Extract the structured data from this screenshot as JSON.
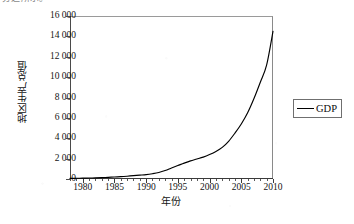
{
  "caption": {
    "truncated_top_text": "分之所示。"
  },
  "legend": {
    "position": "right",
    "entries": [
      {
        "label": "GDP",
        "color": "#000000",
        "marker": "line"
      }
    ]
  },
  "axes": {
    "y_tick_labels": [
      "16 000",
      "14 000",
      "12 000",
      "10 000",
      "8 000",
      "6 000",
      "4 000",
      "2 000",
      "0"
    ],
    "x_tick_labels": [
      "1980",
      "1985",
      "1990",
      "1995",
      "2000",
      "2005",
      "2010"
    ]
  },
  "chart_data": {
    "type": "line",
    "title": "",
    "xlabel": "年份",
    "ylabel": "地区生产总值",
    "xlim": [
      1978,
      2010
    ],
    "ylim": [
      0,
      16000
    ],
    "ytick_step": 2000,
    "xtick_step": 5,
    "x_minor_tick_step": 1,
    "grid": false,
    "legend_position": "right",
    "yticks": [
      0,
      2000,
      4000,
      6000,
      8000,
      10000,
      12000,
      14000,
      16000
    ],
    "ytick_labels": [
      "0",
      "2 000",
      "4 000",
      "6 000",
      "8 000",
      "10 000",
      "12 000",
      "14 000",
      "16 000"
    ],
    "xticks": [
      1980,
      1985,
      1990,
      1995,
      2000,
      2005,
      2010
    ],
    "series": [
      {
        "name": "GDP",
        "color": "#000000",
        "x": [
          1978,
          1979,
          1980,
          1981,
          1982,
          1983,
          1984,
          1985,
          1986,
          1987,
          1988,
          1989,
          1990,
          1991,
          1992,
          1993,
          1994,
          1995,
          1996,
          1997,
          1998,
          1999,
          2000,
          2001,
          2002,
          2003,
          2004,
          2005,
          2006,
          2007,
          2008,
          2009,
          2010
        ],
        "values": [
          60,
          70,
          85,
          95,
          110,
          130,
          160,
          200,
          230,
          275,
          330,
          380,
          430,
          520,
          640,
          830,
          1080,
          1320,
          1560,
          1780,
          1960,
          2150,
          2400,
          2700,
          3100,
          3700,
          4500,
          5400,
          6500,
          7900,
          9500,
          11200,
          14500
        ]
      }
    ]
  }
}
